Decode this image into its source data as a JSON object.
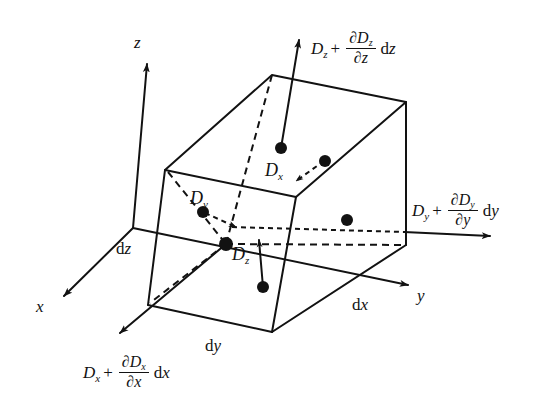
{
  "figure": {
    "kind": "3d-differential-volume-flux-diagram"
  },
  "axes": {
    "x_label": "x",
    "y_label": "y",
    "z_label": "z"
  },
  "dimensions": {
    "dx": "dx",
    "dy": "dy",
    "dz": "dz"
  },
  "interior_components": {
    "dx_label": "Dx",
    "dy_label": "Dy",
    "dz_label": "Dz",
    "dx_symbol": "D",
    "dx_sub": "x",
    "dy_symbol": "D",
    "dy_sub": "y",
    "dz_symbol": "D",
    "dz_sub": "z"
  },
  "flux_expressions": {
    "top": {
      "base": "D",
      "base_sub": "z",
      "operator": "+",
      "numerator": "∂D",
      "numerator_sub": "z",
      "denominator": "∂z",
      "differential": "dz",
      "full_text": "Dz + ∂Dz/∂z dz"
    },
    "right": {
      "base": "D",
      "base_sub": "y",
      "operator": "+",
      "numerator": "∂D",
      "numerator_sub": "y",
      "denominator": "∂y",
      "differential": "dy",
      "full_text": "Dy + ∂Dy/∂y dy"
    },
    "bottom_left": {
      "base": "D",
      "base_sub": "x",
      "operator": "+",
      "numerator": "∂D",
      "numerator_sub": "x",
      "denominator": "∂x",
      "differential": "dx",
      "full_text": "Dx + ∂Dx/∂x dx"
    }
  },
  "colors": {
    "ink": "#121212",
    "background": "#ffffff"
  }
}
